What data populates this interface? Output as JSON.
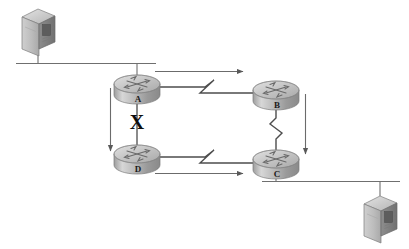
{
  "diagram": {
    "type": "network-topology",
    "title": "",
    "background_color": "#ffffff",
    "device_color": "#b3b3b3",
    "line_color": "#4d4d4d",
    "label_color": "#1a1a1a",
    "break_marker_color": "#0d0d0d",
    "routers": [
      {
        "id": "A",
        "label": "A",
        "name": "router-a",
        "x": 137,
        "y": 84,
        "label_x": 131,
        "label_y": 97
      },
      {
        "id": "B",
        "label": "B",
        "name": "router-b",
        "x": 276,
        "y": 90,
        "label_x": 270,
        "label_y": 103
      },
      {
        "id": "C",
        "label": "C",
        "name": "router-c",
        "x": 276,
        "y": 159,
        "label_x": 270,
        "label_y": 172
      },
      {
        "id": "D",
        "label": "D",
        "name": "router-d",
        "x": 137,
        "y": 154,
        "label_x": 131,
        "label_y": 167
      }
    ],
    "servers": [
      {
        "id": "server-top-left",
        "name": "server-top-left",
        "x": 38,
        "y": 30
      },
      {
        "id": "server-bottom-right",
        "name": "server-bottom-right",
        "x": 380,
        "y": 217
      }
    ],
    "ethernet_segments": [
      {
        "id": "ethernet-top",
        "name": "ethernet-segment-top",
        "x1": 16,
        "x2": 156,
        "y": 63
      },
      {
        "id": "ethernet-bottom",
        "name": "ethernet-segment-bottom",
        "x1": 262,
        "x2": 400,
        "y": 181
      }
    ],
    "serial_links": [
      {
        "id": "link-a-b",
        "name": "serial-link-a-b",
        "from": "A",
        "to": "B",
        "style": "lightning"
      },
      {
        "id": "link-d-c",
        "name": "serial-link-d-c",
        "from": "D",
        "to": "C",
        "style": "lightning"
      },
      {
        "id": "link-b-c",
        "name": "serial-link-b-c",
        "from": "B",
        "to": "C",
        "style": "lightning"
      }
    ],
    "broken_link": {
      "id": "link-a-d",
      "name": "broken-link-a-d",
      "from": "A",
      "to": "D",
      "marker": "X",
      "status": "down"
    },
    "flow_arrows": [
      {
        "id": "flow-top",
        "name": "flow-arrow-a-to-b",
        "direction": "right",
        "x1": 155,
        "x2": 244,
        "y": 71
      },
      {
        "id": "flow-left",
        "name": "flow-arrow-a-to-d",
        "direction": "down",
        "x": 110,
        "y1": 88,
        "y2": 152
      },
      {
        "id": "flow-right",
        "name": "flow-arrow-b-to-c",
        "direction": "down",
        "x": 305,
        "y1": 94,
        "y2": 155
      },
      {
        "id": "flow-bottom",
        "name": "flow-arrow-d-to-c",
        "direction": "right",
        "x1": 155,
        "x2": 244,
        "y": 173
      }
    ]
  }
}
